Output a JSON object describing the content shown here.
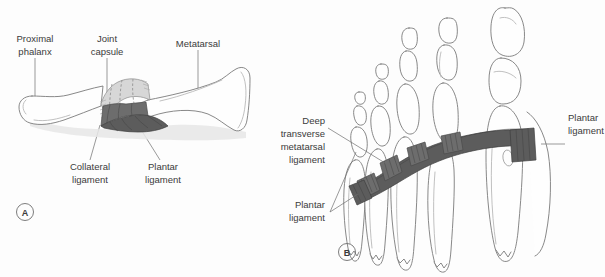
{
  "figure": {
    "background_color": "#fdfdfd",
    "ligament_color": "#5c5c5c",
    "bone_outline_color": "#7a7a7a",
    "text_color": "#3b3b3b"
  },
  "panel_a": {
    "letter": "A",
    "labels": {
      "proximal_phalanx_line1": "Proximal",
      "proximal_phalanx_line2": "phalanx",
      "joint_capsule_line1": "Joint",
      "joint_capsule_line2": "capsule",
      "metatarsal": "Metatarsal",
      "collateral_ligament_line1": "Collateral",
      "collateral_ligament_line2": "ligament",
      "plantar_ligament_line1": "Plantar",
      "plantar_ligament_line2": "ligament"
    }
  },
  "panel_b": {
    "letter": "B",
    "labels": {
      "deep_transverse_line1": "Deep",
      "deep_transverse_line2": "transverse",
      "deep_transverse_line3": "metatarsal",
      "deep_transverse_line4": "ligament",
      "plantar_ligament_left_line1": "Plantar",
      "plantar_ligament_left_line2": "ligament",
      "plantar_ligament_right_line1": "Plantar",
      "plantar_ligament_right_line2": "ligament"
    }
  }
}
